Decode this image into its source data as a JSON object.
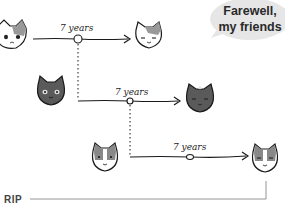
{
  "bubble": {
    "line1": "Farewell,",
    "line2": "my friends",
    "color": "#e6e6e6"
  },
  "timelines": [
    {
      "label": "7 years",
      "from_cat": "calico-cat",
      "to_cat": "calico-cat-aged"
    },
    {
      "label": "7 years",
      "from_cat": "gray-cat",
      "to_cat": "gray-cat-aged"
    },
    {
      "label": "7 years",
      "from_cat": "tabby-white-cat",
      "to_cat": "tabby-white-cat-aged"
    }
  ],
  "rip": {
    "label": "RIP"
  },
  "colors": {
    "line": "#1a1a1a",
    "gray_cat": "#5a5a5a",
    "rip_line": "#888888"
  }
}
